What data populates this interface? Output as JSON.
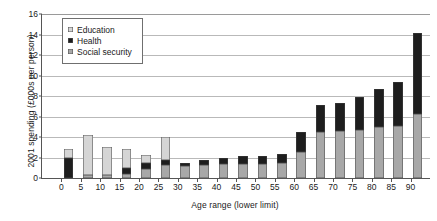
{
  "chart_data": {
    "type": "bar",
    "title": "",
    "subtitle": "",
    "xlabel": "Age range (lower limit)",
    "ylabel": "2001 spending (£000s per person)",
    "stacked": true,
    "grid": true,
    "legend_position": "top-left-inside",
    "xlim": [
      0,
      95
    ],
    "ylim": [
      0,
      16
    ],
    "ytick_step": 2,
    "yticks": [
      0,
      2,
      4,
      6,
      8,
      10,
      12,
      14,
      16
    ],
    "ytick_labels": [
      "0",
      "2",
      "4",
      "6",
      "8",
      "10",
      "12",
      "14",
      "16"
    ],
    "categories": [
      "0",
      "5",
      "10",
      "15",
      "20",
      "25",
      "30",
      "35",
      "40",
      "45",
      "50",
      "55",
      "60",
      "65",
      "70",
      "75",
      "80",
      "85",
      "90"
    ],
    "series": [
      {
        "name": "Social security",
        "color": "#a8a8a8",
        "values": [
          0.0,
          0.3,
          0.25,
          0.4,
          0.9,
          1.3,
          1.15,
          1.3,
          1.35,
          1.4,
          1.4,
          1.5,
          2.5,
          4.5,
          4.6,
          4.7,
          5.0,
          5.1,
          6.2
        ]
      },
      {
        "name": "Health",
        "color": "#1e1e1e",
        "values": [
          2.0,
          0.0,
          0.0,
          0.6,
          0.55,
          0.45,
          0.35,
          0.45,
          0.6,
          0.7,
          0.75,
          0.85,
          2.0,
          2.6,
          2.7,
          3.2,
          3.7,
          4.3,
          7.9
        ]
      },
      {
        "name": "Education",
        "color": "#d5d5d5",
        "values": [
          0.85,
          3.9,
          2.8,
          1.85,
          0.8,
          2.25,
          0.0,
          0.0,
          0.0,
          0.0,
          0.0,
          0.0,
          0.0,
          0.0,
          0.0,
          0.0,
          0.0,
          0.0,
          0.0
        ]
      }
    ],
    "totals": [
      2.85,
      4.2,
      3.05,
      2.85,
      2.25,
      4.0,
      1.5,
      1.75,
      1.95,
      2.1,
      2.15,
      2.35,
      4.5,
      7.1,
      7.3,
      7.9,
      8.7,
      9.4,
      14.1
    ]
  },
  "legend": {
    "items": [
      {
        "label": "Education",
        "color": "#d5d5d5"
      },
      {
        "label": "Health",
        "color": "#1e1e1e"
      },
      {
        "label": "Social security",
        "color": "#a8a8a8"
      }
    ]
  }
}
